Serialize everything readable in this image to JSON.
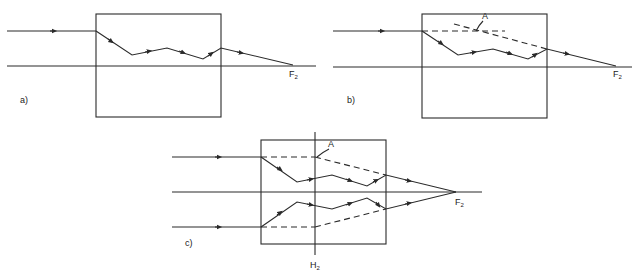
{
  "panels": [
    {
      "id": "a",
      "label": "a)",
      "focus_label": "F",
      "focus_sub": "2"
    },
    {
      "id": "b",
      "label": "b)",
      "focus_label": "F",
      "focus_sub": "2",
      "point_label": "A"
    },
    {
      "id": "c",
      "label": "c)",
      "focus_label": "F",
      "focus_sub": "2",
      "point_label": "A",
      "plane_label": "H",
      "plane_sub": "2"
    }
  ],
  "colors": {
    "line": "#2a2a2a",
    "background": "#ffffff"
  }
}
